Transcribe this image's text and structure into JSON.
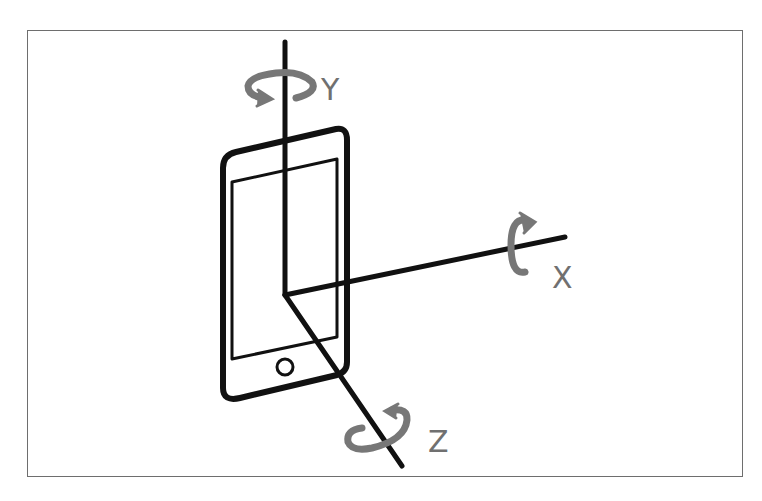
{
  "diagram": {
    "colors": {
      "frame": "#6e6e6e",
      "axis": "#111111",
      "phone": "#111111",
      "rotation_arrow": "#777777",
      "label": "#707070"
    },
    "axes": [
      {
        "id": "y",
        "label": "Y",
        "icon": "rotation-arrow-horizontal"
      },
      {
        "id": "x",
        "label": "X",
        "icon": "rotation-arrow-vertical"
      },
      {
        "id": "z",
        "label": "Z",
        "icon": "rotation-arrow-tilted"
      }
    ],
    "device": {
      "type": "smartphone",
      "icon": "phone-icon"
    }
  }
}
